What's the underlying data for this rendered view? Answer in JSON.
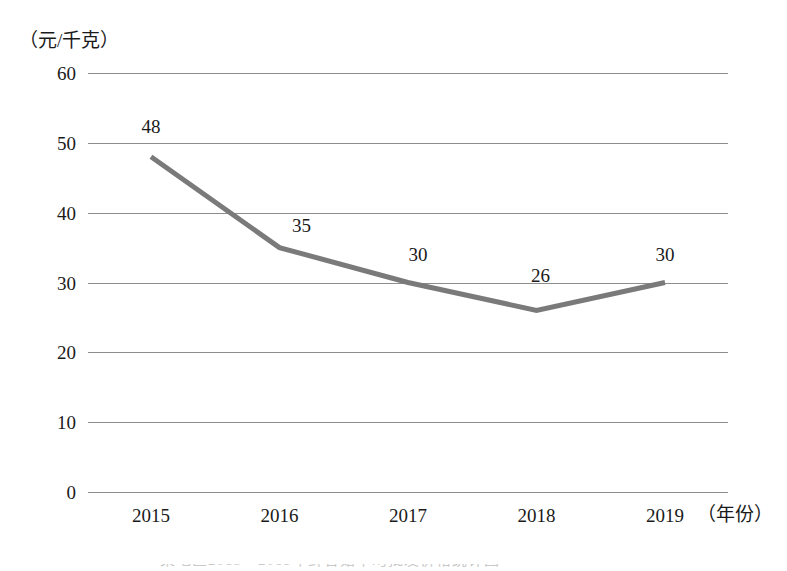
{
  "axes": {
    "y_unit_label": "（元/千克）",
    "x_unit_label": "（年份）"
  },
  "caption": {
    "text": "某地区2015—2019年鲜香菇平均批发价格统计图"
  },
  "chart_data": {
    "type": "line",
    "title": "",
    "subtitle": "",
    "xlabel": "（年份）",
    "ylabel": "（元/千克）",
    "categories": [
      "2015",
      "2016",
      "2017",
      "2018",
      "2019"
    ],
    "values": [
      48,
      35,
      30,
      26,
      30
    ],
    "point_labels": [
      "48",
      "35",
      "30",
      "26",
      "30"
    ],
    "ylim": [
      0,
      60
    ],
    "ytick_labels": [
      "60",
      "50",
      "40",
      "30",
      "20",
      "10",
      "0"
    ],
    "ytick_values": [
      60,
      50,
      40,
      30,
      20,
      10,
      0
    ],
    "ystep": 10,
    "grid": "horizontal",
    "legend": "none",
    "markers": "none",
    "series": [
      {
        "name": "平均批发价格",
        "values": [
          48,
          35,
          30,
          26,
          30
        ]
      }
    ],
    "colors": {
      "line": "#7a7a7a",
      "grid": "#8d8d8d",
      "text": "#1a1a1a",
      "background": "#ffffff"
    },
    "line_width": 5
  }
}
